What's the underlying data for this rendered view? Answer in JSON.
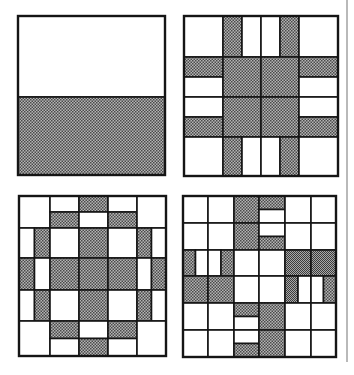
{
  "figure": {
    "colors": {
      "background": "#ffffff",
      "stroke": "#151515",
      "shade": "#8a8a8a",
      "shade_dark": "#555555",
      "shade_fine": "#7a7a7a",
      "side_rule": "#b9b9b9"
    },
    "panels": [
      {
        "id": "panel-top-left",
        "box": [
          18,
          16,
          165,
          175
        ],
        "cols": [
          18,
          165
        ],
        "rows": [
          16,
          97,
          175
        ],
        "cells": [
          [
            "W"
          ],
          [
            "G"
          ]
        ]
      },
      {
        "id": "panel-top-right",
        "box": [
          184,
          16,
          338,
          176
        ],
        "cols": [
          184,
          223,
          261,
          299,
          338
        ],
        "rows": [
          16,
          57,
          97,
          137,
          176
        ],
        "cells": [
          [
            "W",
            "V:GW",
            "V:WG",
            "W"
          ],
          [
            "H:GW",
            "G",
            "G",
            "H:GW"
          ],
          [
            "H:WG",
            "G",
            "G",
            "H:WG"
          ],
          [
            "W",
            "V:GW",
            "V:WG",
            "W"
          ]
        ]
      },
      {
        "id": "panel-bottom-left",
        "box": [
          19,
          196,
          166,
          356
        ],
        "cols": [
          19,
          50,
          79,
          108,
          137,
          166
        ],
        "rows": [
          196,
          228,
          258,
          290,
          321,
          356
        ],
        "cells": [
          [
            "W",
            "H:WG",
            "H:GW",
            "H:WG",
            "W"
          ],
          [
            "V:WG",
            "W",
            "G",
            "W",
            "V:GW"
          ],
          [
            "V:GW",
            "G",
            "G",
            "G",
            "V:WG"
          ],
          [
            "V:WG",
            "W",
            "G",
            "W",
            "V:GW"
          ],
          [
            "W",
            "H:GW",
            "H:WG",
            "H:GW",
            "W"
          ]
        ]
      },
      {
        "id": "panel-bottom-right",
        "box": [
          183,
          196,
          336,
          357
        ],
        "cols": [
          183,
          208,
          234,
          259,
          285,
          311,
          336
        ],
        "rows": [
          196,
          223,
          250,
          276,
          303,
          330,
          357
        ],
        "cells": [
          [
            "W",
            "W",
            "G",
            "H:GW",
            "W",
            "W"
          ],
          [
            "W",
            "W",
            "G",
            "H:WG",
            "W",
            "W"
          ],
          [
            "V:GW",
            "V:WG",
            "W",
            "W",
            "F",
            "F"
          ],
          [
            "G",
            "G",
            "W",
            "W",
            "V:FW",
            "V:WG"
          ],
          [
            "W",
            "W",
            "H:GW",
            "G",
            "W",
            "W"
          ],
          [
            "W",
            "W",
            "H:WG",
            "G",
            "W",
            "W"
          ]
        ]
      }
    ],
    "legend": {
      "W": "white cell",
      "G": "halftone gray cell",
      "F": "fine-screen gray cell",
      "H:AB": "cell split horizontally, top A / bottom B",
      "V:AB": "cell split vertically, left A / right B"
    }
  }
}
